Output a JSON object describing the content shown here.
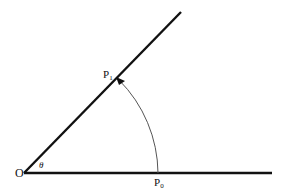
{
  "diagram": {
    "type": "angle-rotation",
    "labels": {
      "origin": "O",
      "angle": "θ",
      "p1_base": "P",
      "p1_sub": "1",
      "p0_base": "P",
      "p0_sub": "0"
    },
    "colors": {
      "line": "#111111",
      "arc": "#555555",
      "background": "#ffffff"
    }
  }
}
